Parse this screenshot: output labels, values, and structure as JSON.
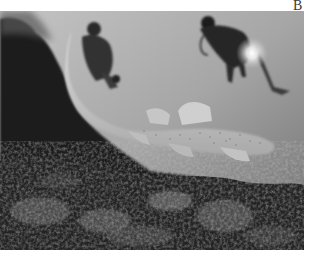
{
  "figure": {
    "panel_label": "B",
    "photo": {
      "description": "Grayscale underwater photograph of a spotted zebra (leopard) shark swimming over a rocky reef with two scuba divers behind it, one holding a bright dive light",
      "subjects": [
        "shark",
        "diver-left",
        "diver-right-with-light",
        "rocky-reef"
      ],
      "palette": {
        "water_light": "#b8b8b8",
        "water_mid": "#8e8e8e",
        "rock_dark": "#141414",
        "shark_body": "#d8d8d8",
        "light_glow": "#ffffff"
      }
    }
  }
}
